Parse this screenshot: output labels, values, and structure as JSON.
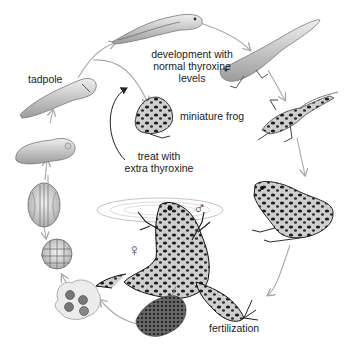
{
  "diagram": {
    "type": "life-cycle",
    "subject": "frog",
    "labels": {
      "tadpole": "tadpole",
      "development": [
        "development with",
        "normal thyroxine",
        "levels"
      ],
      "miniature_frog": "miniature frog",
      "treat": [
        "treat with",
        "extra thyroxine"
      ],
      "fertilization": "fertilization"
    },
    "symbols": {
      "male": "♂",
      "female": "♀"
    },
    "stages": [
      "egg mass",
      "early cleavage (4-cell)",
      "morula",
      "neurula",
      "early tadpole",
      "tadpole",
      "older tadpole",
      "tadpole with hind legs",
      "froglet with tail",
      "adult frog",
      "mating frogs (amplexus)",
      "miniature frog"
    ],
    "colors": {
      "arrow": "#a8a8a8",
      "black_arrow": "#222222",
      "ink": "#2a2a2a",
      "shade": "#bdbdbd",
      "light": "#e4e4e4"
    }
  }
}
